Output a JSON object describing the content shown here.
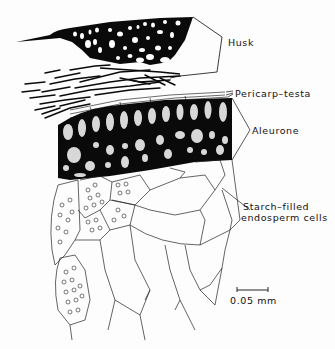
{
  "figure": {
    "type": "cross-section diagram",
    "labels": {
      "husk": "Husk",
      "pericarp_testa": "Pericarp–testa",
      "aleurone": "Aleurone",
      "starch_line1": "Starch–filled",
      "starch_line2": "endosperm cells"
    },
    "scale_bar": {
      "label": "0.05 mm"
    },
    "colors": {
      "ink": "#0a0a0a",
      "paper": "#fdfdfd",
      "stipple": "#d8d8d8"
    }
  }
}
